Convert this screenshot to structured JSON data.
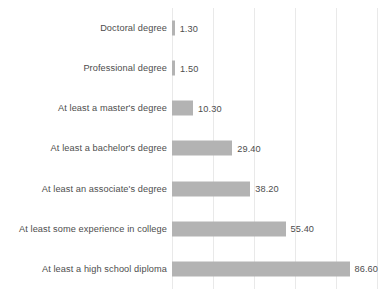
{
  "chart_data": {
    "type": "bar",
    "orientation": "horizontal",
    "title": "",
    "subtitle": "",
    "xlabel": "",
    "ylabel": "",
    "xlim": [
      0,
      100
    ],
    "grid": true,
    "gridlines": [
      0,
      20,
      40,
      60,
      80,
      100
    ],
    "legend": "none",
    "bar_color": "#b3b3b3",
    "label_color": "#4d4d4d",
    "gridline_color": "#e9e9e9",
    "categories": [
      "Doctoral degree",
      "Professional degree",
      "At least a master's degree",
      "At least a bachelor's degree",
      "At least an associate's degree",
      "At least some experience in college",
      "At least a high school diploma"
    ],
    "values": [
      1.3,
      1.5,
      10.3,
      29.4,
      38.2,
      55.4,
      86.6
    ],
    "value_labels": [
      "1.30",
      "1.50",
      "10.30",
      "29.40",
      "38.20",
      "55.40",
      "86.60"
    ]
  }
}
